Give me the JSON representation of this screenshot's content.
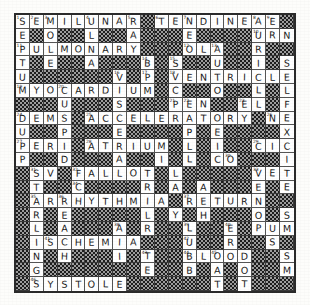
{
  "puzzle": {
    "title": "Cardiology Crossword Grid",
    "rows": 20,
    "cols": 20,
    "block_char": "#",
    "colors": {
      "paper": "#fdfdfb",
      "cell": "#ffffff",
      "block": "#4a4a4a",
      "ink": "#1a1a1a",
      "border": "#2b2b2b"
    },
    "grid": [
      [
        "S",
        "E",
        "M",
        "I",
        "L",
        "U",
        "N",
        "A",
        "R",
        "#",
        "T",
        "E",
        "N",
        "D",
        "I",
        "N",
        "E",
        "A",
        "E",
        "#"
      ],
      [
        "E",
        "#",
        "O",
        "#",
        "#",
        "L",
        "#",
        "#",
        "A",
        "#",
        "#",
        "#",
        "E",
        "#",
        "#",
        "#",
        "#",
        "U",
        "R",
        "N"
      ],
      [
        "P",
        "U",
        "L",
        "M",
        "O",
        "N",
        "A",
        "R",
        "Y",
        "#",
        "#",
        "#",
        "O",
        "L",
        "A",
        "#",
        "#",
        "R",
        "#",
        "#"
      ],
      [
        "T",
        "#",
        "E",
        "#",
        "#",
        "A",
        "#",
        "#",
        "#",
        "B",
        "#",
        "S",
        "#",
        "#",
        "U",
        "#",
        "#",
        "I",
        "#",
        "S"
      ],
      [
        "U",
        "#",
        "#",
        "#",
        "#",
        "#",
        "#",
        "V",
        "#",
        "P",
        "#",
        "V",
        "E",
        "N",
        "T",
        "R",
        "I",
        "C",
        "L",
        "E"
      ],
      [
        "M",
        "Y",
        "O",
        "C",
        "A",
        "R",
        "D",
        "I",
        "U",
        "M",
        "#",
        "C",
        "#",
        "#",
        "O",
        "#",
        "#",
        "L",
        "#",
        "L"
      ],
      [
        "#",
        "#",
        "#",
        "U",
        "#",
        "#",
        "#",
        "S",
        "#",
        "#",
        "#",
        "P",
        "E",
        "N",
        "#",
        "#",
        "E",
        "L",
        "#",
        "F"
      ],
      [
        "D",
        "E",
        "M",
        "S",
        "#",
        "A",
        "C",
        "C",
        "E",
        "L",
        "E",
        "R",
        "A",
        "T",
        "O",
        "R",
        "Y",
        "#",
        "N",
        "E"
      ],
      [
        "U",
        "#",
        "#",
        "P",
        "#",
        "#",
        "#",
        "E",
        "#",
        "#",
        "#",
        "#",
        "P",
        "#",
        "E",
        "#",
        "#",
        "#",
        "#",
        "X"
      ],
      [
        "P",
        "E",
        "R",
        "I",
        "#",
        "A",
        "T",
        "R",
        "I",
        "U",
        "M",
        "#",
        "L",
        "#",
        "I",
        "#",
        "#",
        "C",
        "I",
        "C"
      ],
      [
        "P",
        "#",
        "#",
        "D",
        "#",
        "#",
        "#",
        "A",
        "#",
        "#",
        "I",
        "#",
        "L",
        "#",
        "C",
        "O",
        "#",
        "#",
        "#",
        "I"
      ],
      [
        "#",
        "S",
        "V",
        "#",
        "F",
        "A",
        "L",
        "L",
        "O",
        "T",
        "#",
        "L",
        "#",
        "#",
        "#",
        "#",
        "#",
        "V",
        "E",
        "T"
      ],
      [
        "#",
        "T",
        "#",
        "#",
        "C",
        "#",
        "#",
        "#",
        "#",
        "R",
        "#",
        "A",
        "#",
        "A",
        "#",
        "#",
        "#",
        "E",
        "#",
        "E"
      ],
      [
        "#",
        "A",
        "R",
        "R",
        "H",
        "Y",
        "T",
        "H",
        "M",
        "I",
        "A",
        "#",
        "R",
        "E",
        "T",
        "U",
        "R",
        "N",
        "#",
        "#"
      ],
      [
        "#",
        "R",
        "#",
        "E",
        "#",
        "#",
        "#",
        "#",
        "#",
        "L",
        "#",
        "Y",
        "#",
        "H",
        "#",
        "#",
        "#",
        "O",
        "#",
        "S"
      ],
      [
        "#",
        "L",
        "#",
        "A",
        "#",
        "#",
        "#",
        "A",
        "#",
        "R",
        "#",
        "#",
        "L",
        "#",
        "#",
        "E",
        "#",
        "P",
        "U",
        "M"
      ],
      [
        "#",
        "I",
        "S",
        "C",
        "H",
        "E",
        "M",
        "I",
        "A",
        "#",
        "#",
        "#",
        "U",
        "#",
        "#",
        "R",
        "#",
        "#",
        "S",
        "#"
      ],
      [
        "#",
        "N",
        "#",
        "H",
        "#",
        "#",
        "#",
        "I",
        "#",
        "T",
        "#",
        "#",
        "B",
        "L",
        "O",
        "O",
        "D",
        "#",
        "#",
        "S"
      ],
      [
        "#",
        "G",
        "#",
        "#",
        "#",
        "#",
        "#",
        "#",
        "#",
        "E",
        "#",
        "#",
        "B",
        "#",
        "A",
        "#",
        "O",
        "#",
        "#",
        "M"
      ],
      [
        "#",
        "S",
        "Y",
        "S",
        "T",
        "O",
        "L",
        "E",
        "#",
        "#",
        "#",
        "#",
        "#",
        "#",
        "T",
        "#",
        "T",
        "#",
        "#",
        "#"
      ]
    ],
    "numbers": {
      "0_0": "1",
      "0_1": "2",
      "0_2": "3",
      "0_5": "4",
      "0_8": "5",
      "0_10": "6",
      "0_12": "7",
      "0_17": "8",
      "0_18": "9",
      "1_17": "10",
      "2_0": "11",
      "2_12": "12",
      "2_14": "13",
      "3_9": "14",
      "3_11": "15",
      "4_7": "16",
      "4_9": "17",
      "4_11": "18",
      "5_0": "19",
      "5_3": "20",
      "6_11": "21",
      "6_12": "22",
      "6_16": "23",
      "7_0": "24",
      "7_5": "25",
      "7_18": "26",
      "9_0": "27",
      "9_5": "28",
      "9_17": "29",
      "10_15": "30",
      "11_1": "31",
      "11_4": "32",
      "11_17": "33",
      "12_4": "34",
      "13_1": "35",
      "13_3": "36",
      "13_12": "37",
      "15_7": "38",
      "15_12": "39",
      "15_15": "40",
      "16_2": "41",
      "16_12": "42",
      "17_9": "43",
      "17_12": "44",
      "17_14": "45",
      "19_1": "46"
    }
  }
}
